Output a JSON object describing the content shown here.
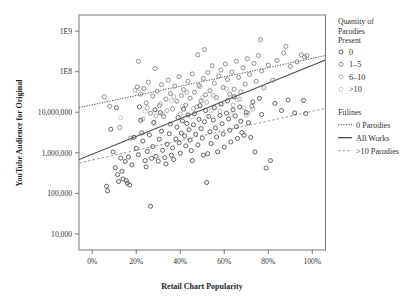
{
  "chart_data": {
    "type": "scatter",
    "title": "",
    "xlabel": "Retail Chart Popularity",
    "ylabel": "YouTube Audience for Original",
    "x_ticklabels": [
      "0%",
      "20%",
      "40%",
      "60%",
      "80%",
      "100%"
    ],
    "x_tickvalues": [
      0,
      20,
      40,
      60,
      80,
      100
    ],
    "xlim": [
      -6,
      106
    ],
    "y_ticklabels": [
      "1E9",
      "1E8",
      "10,000,000",
      "1,000,000",
      "100,000",
      "10,000"
    ],
    "y_tickvalues": [
      1000000000,
      100000000,
      10000000,
      1000000,
      100000,
      10000
    ],
    "ylim": [
      4000,
      2500000000
    ],
    "y_scale": "log",
    "grid": false,
    "legend_position": "right",
    "series": [
      {
        "name": "0",
        "color": "#4a4a4a",
        "marker": "open-circle",
        "points": [
          [
            6.5,
            150000
          ],
          [
            7.0,
            115000
          ],
          [
            8.5,
            3800000
          ],
          [
            9.5,
            1050000
          ],
          [
            10.5,
            430000
          ],
          [
            11.0,
            13000000
          ],
          [
            11.5,
            290000
          ],
          [
            12.0,
            195000
          ],
          [
            13.0,
            740000
          ],
          [
            13.5,
            350000
          ],
          [
            14.0,
            225000
          ],
          [
            15.0,
            610000
          ],
          [
            15.5,
            205000
          ],
          [
            16.0,
            178000
          ],
          [
            16.5,
            790000
          ],
          [
            17.0,
            160000
          ],
          [
            18.0,
            505000
          ],
          [
            19.0,
            2400000
          ],
          [
            20.0,
            1280000
          ],
          [
            21.0,
            900000
          ],
          [
            21.5,
            13500000
          ],
          [
            22.0,
            6300000
          ],
          [
            22.5,
            3100000
          ],
          [
            23.0,
            1950000
          ],
          [
            24.0,
            640000
          ],
          [
            24.5,
            450000
          ],
          [
            25.0,
            1080000
          ],
          [
            26.0,
            2750000
          ],
          [
            26.5,
            48000
          ],
          [
            27.0,
            730000
          ],
          [
            27.5,
            1420000
          ],
          [
            28.0,
            5600000
          ],
          [
            28.5,
            11500000
          ],
          [
            29.0,
            820000
          ],
          [
            30.0,
            620000
          ],
          [
            30.5,
            2150000
          ],
          [
            31.0,
            9800000
          ],
          [
            31.5,
            3400000
          ],
          [
            32.0,
            1150000
          ],
          [
            33.0,
            760000
          ],
          [
            33.5,
            530000
          ],
          [
            34.0,
            1620000
          ],
          [
            35.0,
            2950000
          ],
          [
            35.5,
            5100000
          ],
          [
            36.0,
            870000
          ],
          [
            36.5,
            1320000
          ],
          [
            37.0,
            680000
          ],
          [
            38.0,
            2200000
          ],
          [
            38.5,
            4300000
          ],
          [
            39.0,
            7400000
          ],
          [
            39.5,
            1750000
          ],
          [
            40.0,
            980000
          ],
          [
            40.5,
            3050000
          ],
          [
            41.0,
            6100000
          ],
          [
            41.5,
            12000000
          ],
          [
            42.0,
            2600000
          ],
          [
            42.5,
            1480000
          ],
          [
            43.0,
            5300000
          ],
          [
            43.5,
            8600000
          ],
          [
            44.0,
            3700000
          ],
          [
            44.5,
            2050000
          ],
          [
            45.0,
            1130000
          ],
          [
            45.5,
            640000
          ],
          [
            46.0,
            4900000
          ],
          [
            46.5,
            9200000
          ],
          [
            47.0,
            2850000
          ],
          [
            48.0,
            1560000
          ],
          [
            48.5,
            6700000
          ],
          [
            49.0,
            14500000
          ],
          [
            49.5,
            3950000
          ],
          [
            50.0,
            2300000
          ],
          [
            50.5,
            870000
          ],
          [
            51.0,
            5800000
          ],
          [
            51.5,
            11000000
          ],
          [
            52.0,
            185000
          ],
          [
            52.5,
            950000
          ],
          [
            53.0,
            7900000
          ],
          [
            53.5,
            3300000
          ],
          [
            54.0,
            1700000
          ],
          [
            55.0,
            6400000
          ],
          [
            55.5,
            13000000
          ],
          [
            56.0,
            4100000
          ],
          [
            56.5,
            2450000
          ],
          [
            57.0,
            1050000
          ],
          [
            58.0,
            8300000
          ],
          [
            58.5,
            16000000
          ],
          [
            59.0,
            5200000
          ],
          [
            59.5,
            2900000
          ],
          [
            60.0,
            1380000
          ],
          [
            61.0,
            9500000
          ],
          [
            61.5,
            19000000
          ],
          [
            62.0,
            6800000
          ],
          [
            62.5,
            3600000
          ],
          [
            63.0,
            1850000
          ],
          [
            64.0,
            11500000
          ],
          [
            64.5,
            24000000
          ],
          [
            65.0,
            8100000
          ],
          [
            65.5,
            4400000
          ],
          [
            66.0,
            2250000
          ],
          [
            67.0,
            13500000
          ],
          [
            67.5,
            6000000
          ],
          [
            68.0,
            3150000
          ],
          [
            69.0,
            2700000
          ],
          [
            70.0,
            9900000
          ],
          [
            71.0,
            5500000
          ],
          [
            72.0,
            2400000
          ],
          [
            73.0,
            18000000
          ],
          [
            74.0,
            1050000
          ],
          [
            76.0,
            22000000
          ],
          [
            77.0,
            8800000
          ],
          [
            79.0,
            420000
          ],
          [
            81.0,
            640000
          ],
          [
            83.0,
            16500000
          ],
          [
            86.0,
            11000000
          ],
          [
            89.0,
            20000000
          ],
          [
            92.0,
            9600000
          ],
          [
            96.0,
            19500000
          ],
          [
            97.0,
            9300000
          ]
        ]
      },
      {
        "name": "1–5",
        "color": "#7d7d7d",
        "marker": "open-circle",
        "points": [
          [
            5.5,
            24000000
          ],
          [
            8.0,
            14000000
          ],
          [
            12.5,
            4200000
          ],
          [
            17.5,
            2300000
          ],
          [
            20.5,
            42000000
          ],
          [
            21.0,
            180000000
          ],
          [
            22.0,
            28000000
          ],
          [
            23.5,
            38000000
          ],
          [
            24.5,
            17000000
          ],
          [
            25.5,
            55000000
          ],
          [
            26.5,
            9500000
          ],
          [
            27.5,
            25000000
          ],
          [
            28.5,
            120000000
          ],
          [
            29.5,
            33000000
          ],
          [
            30.5,
            14500000
          ],
          [
            31.5,
            48000000
          ],
          [
            32.5,
            7800000
          ],
          [
            33.5,
            21000000
          ],
          [
            34.5,
            62000000
          ],
          [
            35.5,
            29000000
          ],
          [
            36.5,
            12000000
          ],
          [
            37.5,
            44000000
          ],
          [
            38.5,
            18500000
          ],
          [
            39.5,
            75000000
          ],
          [
            40.5,
            26000000
          ],
          [
            41.5,
            36000000
          ],
          [
            42.5,
            15000000
          ],
          [
            43.5,
            58000000
          ],
          [
            44.5,
            22000000
          ],
          [
            45.5,
            88000000
          ],
          [
            46.5,
            31000000
          ],
          [
            47.5,
            13500000
          ],
          [
            48.0,
            260000000
          ],
          [
            48.5,
            46000000
          ],
          [
            49.5,
            19000000
          ],
          [
            50.5,
            68000000
          ],
          [
            51.0,
            350000000
          ],
          [
            51.5,
            27000000
          ],
          [
            52.5,
            95000000
          ],
          [
            53.5,
            34000000
          ],
          [
            54.5,
            140000000
          ],
          [
            55.5,
            52000000
          ],
          [
            56.5,
            23000000
          ],
          [
            57.5,
            78000000
          ],
          [
            58.5,
            110000000
          ],
          [
            59.5,
            41000000
          ],
          [
            60.5,
            155000000
          ],
          [
            61.5,
            64000000
          ],
          [
            62.5,
            28000000
          ],
          [
            63.5,
            98000000
          ],
          [
            64.5,
            37000000
          ],
          [
            65.5,
            180000000
          ],
          [
            66.5,
            72000000
          ],
          [
            67.5,
            32000000
          ],
          [
            68.5,
            125000000
          ],
          [
            69.5,
            49000000
          ],
          [
            70.5,
            210000000
          ],
          [
            71.5,
            85000000
          ],
          [
            72.5,
            14000000
          ],
          [
            73.5,
            160000000
          ],
          [
            74.5,
            58000000
          ],
          [
            75.5,
            250000000
          ],
          [
            76.5,
            620000000
          ],
          [
            77.0,
            105000000
          ],
          [
            78.0,
            40000000
          ],
          [
            80.0,
            145000000
          ],
          [
            82.0,
            62000000
          ],
          [
            84.0,
            190000000
          ],
          [
            87.0,
            290000000
          ],
          [
            88.0,
            420000000
          ],
          [
            90.0,
            135000000
          ],
          [
            93.0,
            175000000
          ],
          [
            95.0,
            260000000
          ],
          [
            96.5,
            230000000
          ],
          [
            97.5,
            250000000
          ]
        ]
      },
      {
        "name": "6–10",
        "color": "#a6a6a6",
        "marker": "open-circle",
        "points": [
          [
            19.5,
            35000000
          ],
          [
            23.0,
            6800000
          ],
          [
            25.0,
            13000000
          ],
          [
            29.0,
            8200000
          ],
          [
            31.0,
            16000000
          ],
          [
            34.0,
            11000000
          ],
          [
            37.0,
            24000000
          ],
          [
            40.0,
            9000000
          ],
          [
            43.0,
            31000000
          ],
          [
            46.0,
            12500000
          ],
          [
            49.0,
            43000000
          ],
          [
            52.0,
            17500000
          ],
          [
            55.0,
            26000000
          ],
          [
            58.0,
            10500000
          ],
          [
            61.0,
            38000000
          ],
          [
            64.0,
            15000000
          ],
          [
            67.0,
            21000000
          ],
          [
            70.0,
            8500000
          ],
          [
            73.0,
            12000000
          ]
        ]
      },
      {
        "name": ">10",
        "color": "#c4c4c4",
        "marker": "open-circle",
        "points": [
          [
            13.0,
            7300000
          ],
          [
            21.5,
            38000000
          ],
          [
            24.0,
            10500000
          ],
          [
            28.0,
            5200000
          ],
          [
            32.0,
            9000000
          ],
          [
            36.0,
            19000000
          ],
          [
            41.0,
            14000000
          ],
          [
            45.0,
            7600000
          ],
          [
            50.0,
            23000000
          ],
          [
            54.0,
            11000000
          ],
          [
            59.0,
            16000000
          ],
          [
            63.0,
            8800000
          ],
          [
            66.0,
            20000000
          ],
          [
            69.0,
            13000000
          ],
          [
            71.0,
            9500000
          ]
        ]
      }
    ],
    "fitlines": [
      {
        "name": "0 Parodies",
        "style": "dotted",
        "color": "#4a4a4a",
        "x1": -6,
        "y1": 13000000,
        "x2": 106,
        "y2": 250000000
      },
      {
        "name": "All Works",
        "style": "solid",
        "color": "#4a4a4a",
        "x1": -6,
        "y1": 680000,
        "x2": 106,
        "y2": 195000000
      },
      {
        "name": ">10 Parodies",
        "style": "dashed",
        "color": "#9a9a9a",
        "x1": -6,
        "y1": 560000,
        "x2": 106,
        "y2": 12500000
      }
    ]
  },
  "legend": {
    "markers_title_lines": [
      "Quantity of",
      "Parodies",
      "Present"
    ],
    "markers_title": "Quantity of Parodies Present",
    "marker_items": [
      {
        "label": "0",
        "color": "#4a4a4a"
      },
      {
        "label": "1–5",
        "color": "#7d7d7d"
      },
      {
        "label": "6–10",
        "color": "#a6a6a6"
      },
      {
        "label": ">10",
        "color": "#c4c4c4"
      }
    ],
    "fitlines_title": "Fitlines",
    "fitline_items": [
      {
        "label": "0 Parodies",
        "style": "dotted",
        "color": "#4a4a4a"
      },
      {
        "label": "All Works",
        "style": "solid",
        "color": "#4a4a4a"
      },
      {
        "label": ">10 Parodies",
        "style": "dashed",
        "color": "#9a9a9a"
      }
    ]
  },
  "colors": {
    "frame": "#6b6b6b",
    "text": "#2f2f2f",
    "background": "#ffffff"
  }
}
